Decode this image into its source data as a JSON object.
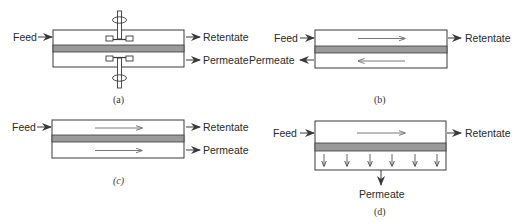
{
  "colors": {
    "line": "#3a3a3a",
    "membrane": "#9a9a9a",
    "flow_arrow": "#7a7a7a",
    "text": "#2a2a2a"
  },
  "panels": [
    {
      "id": "a",
      "caption": "(a)",
      "feed_label": "Feed",
      "retentate_label": "Retentate",
      "permeate_label": "Permeate",
      "description": "Stirred cell with impellers on both sides of membrane"
    },
    {
      "id": "b",
      "caption": "(b)",
      "feed_label": "Feed",
      "retentate_label": "Retentate",
      "permeate_label": "Permeate",
      "description": "Countercurrent flow"
    },
    {
      "id": "c",
      "caption": "(c)",
      "feed_label": "Feed",
      "retentate_label": "Retentate",
      "permeate_label": "Permeate",
      "description": "Cocurrent flow"
    },
    {
      "id": "d",
      "caption": "(d)",
      "feed_label": "Feed",
      "retentate_label": "Retentate",
      "permeate_label": "Permeate",
      "description": "Cross flow with perpendicular permeate"
    }
  ]
}
